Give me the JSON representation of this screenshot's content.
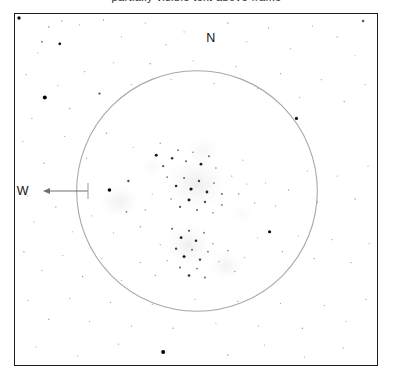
{
  "page": {
    "background_color": "#ffffff",
    "width": 393,
    "height": 381,
    "caption_clipped": "partially visible text above frame"
  },
  "frame": {
    "border_color": "#1b1b1b",
    "border_width": 1.5,
    "fill_color": "#ffffff",
    "x": 14,
    "y": 13,
    "width": 364,
    "height": 353
  },
  "field_circle": {
    "name": "eyepiece-field-of-view",
    "center_x": 197,
    "center_y": 191,
    "radius": 121,
    "stroke_color": "#a9a9a9",
    "stroke_width": 1.1,
    "fill": "none"
  },
  "compass": {
    "north_label": "N",
    "south_label": "S",
    "east_label": "E",
    "west_label": "W",
    "arrow_direction": "west",
    "arrow_color": "#6f6f6f"
  },
  "chart_data": {
    "type": "scatter",
    "xlabel": "",
    "ylabel": "",
    "xlim": [
      14,
      378
    ],
    "ylim": [
      13,
      366
    ],
    "grid": false,
    "legend": null,
    "annotations": [
      "N",
      "E",
      "S",
      "W"
    ],
    "nebulous_patches": [
      {
        "name": "central-cluster-glow",
        "cx": 196,
        "cy": 184,
        "rx": 36,
        "ry": 30,
        "opacity": 0.2
      },
      {
        "name": "west-glow",
        "cx": 119,
        "cy": 201,
        "rx": 24,
        "ry": 20,
        "opacity": 0.16
      },
      {
        "name": "south-cluster-glow",
        "cx": 189,
        "cy": 246,
        "rx": 26,
        "ry": 24,
        "opacity": 0.19
      },
      {
        "name": "southeast-glow",
        "cx": 226,
        "cy": 266,
        "rx": 19,
        "ry": 17,
        "opacity": 0.15
      },
      {
        "name": "north-halo",
        "cx": 203,
        "cy": 150,
        "rx": 22,
        "ry": 16,
        "opacity": 0.1
      },
      {
        "name": "faint-northwest-haze",
        "cx": 152,
        "cy": 167,
        "rx": 16,
        "ry": 13,
        "opacity": 0.08
      },
      {
        "name": "faint-east-haze",
        "cx": 243,
        "cy": 214,
        "rx": 14,
        "ry": 12,
        "opacity": 0.07
      }
    ],
    "stars": [
      {
        "x": 18,
        "y": 17,
        "r": 1.7,
        "m": 0.95
      },
      {
        "x": 41,
        "y": 41,
        "r": 1.0,
        "m": 0.35
      },
      {
        "x": 48,
        "y": 26,
        "r": 0.8,
        "m": 0.28
      },
      {
        "x": 61,
        "y": 20,
        "r": 0.7,
        "m": 0.22
      },
      {
        "x": 37,
        "y": 52,
        "r": 0.6,
        "m": 0.18
      },
      {
        "x": 59,
        "y": 43,
        "r": 1.4,
        "m": 0.92
      },
      {
        "x": 79,
        "y": 24,
        "r": 0.6,
        "m": 0.2
      },
      {
        "x": 103,
        "y": 19,
        "r": 0.7,
        "m": 0.24
      },
      {
        "x": 121,
        "y": 36,
        "r": 0.6,
        "m": 0.17
      },
      {
        "x": 145,
        "y": 22,
        "r": 0.6,
        "m": 0.2
      },
      {
        "x": 166,
        "y": 44,
        "r": 0.7,
        "m": 0.22
      },
      {
        "x": 184,
        "y": 31,
        "r": 0.6,
        "m": 0.16
      },
      {
        "x": 228,
        "y": 22,
        "r": 0.7,
        "m": 0.25
      },
      {
        "x": 247,
        "y": 41,
        "r": 0.6,
        "m": 0.19
      },
      {
        "x": 269,
        "y": 27,
        "r": 0.7,
        "m": 0.23
      },
      {
        "x": 291,
        "y": 48,
        "r": 0.6,
        "m": 0.18
      },
      {
        "x": 313,
        "y": 25,
        "r": 0.6,
        "m": 0.2
      },
      {
        "x": 338,
        "y": 36,
        "r": 0.7,
        "m": 0.22
      },
      {
        "x": 364,
        "y": 20,
        "r": 1.3,
        "m": 0.55
      },
      {
        "x": 356,
        "y": 55,
        "r": 0.6,
        "m": 0.17
      },
      {
        "x": 25,
        "y": 74,
        "r": 0.7,
        "m": 0.24
      },
      {
        "x": 44,
        "y": 97,
        "r": 2.0,
        "m": 1.0
      },
      {
        "x": 31,
        "y": 118,
        "r": 0.6,
        "m": 0.18
      },
      {
        "x": 57,
        "y": 85,
        "r": 0.6,
        "m": 0.19
      },
      {
        "x": 69,
        "y": 108,
        "r": 0.7,
        "m": 0.26
      },
      {
        "x": 84,
        "y": 71,
        "r": 0.6,
        "m": 0.21
      },
      {
        "x": 99,
        "y": 93,
        "r": 1.1,
        "m": 0.6
      },
      {
        "x": 113,
        "y": 62,
        "r": 0.6,
        "m": 0.18
      },
      {
        "x": 131,
        "y": 84,
        "r": 0.6,
        "m": 0.2
      },
      {
        "x": 150,
        "y": 63,
        "r": 0.7,
        "m": 0.27
      },
      {
        "x": 171,
        "y": 79,
        "r": 0.6,
        "m": 0.19
      },
      {
        "x": 193,
        "y": 60,
        "r": 0.6,
        "m": 0.17
      },
      {
        "x": 214,
        "y": 83,
        "r": 0.7,
        "m": 0.24
      },
      {
        "x": 236,
        "y": 66,
        "r": 0.6,
        "m": 0.2
      },
      {
        "x": 258,
        "y": 88,
        "r": 0.6,
        "m": 0.18
      },
      {
        "x": 281,
        "y": 73,
        "r": 0.7,
        "m": 0.23
      },
      {
        "x": 300,
        "y": 97,
        "r": 0.6,
        "m": 0.19
      },
      {
        "x": 322,
        "y": 79,
        "r": 0.6,
        "m": 0.21
      },
      {
        "x": 345,
        "y": 101,
        "r": 0.7,
        "m": 0.25
      },
      {
        "x": 366,
        "y": 84,
        "r": 0.6,
        "m": 0.18
      },
      {
        "x": 297,
        "y": 118,
        "r": 1.6,
        "m": 0.9
      },
      {
        "x": 22,
        "y": 141,
        "r": 0.6,
        "m": 0.19
      },
      {
        "x": 43,
        "y": 163,
        "r": 0.7,
        "m": 0.24
      },
      {
        "x": 64,
        "y": 136,
        "r": 0.6,
        "m": 0.18
      },
      {
        "x": 86,
        "y": 158,
        "r": 0.6,
        "m": 0.2
      },
      {
        "x": 106,
        "y": 133,
        "r": 0.7,
        "m": 0.26
      },
      {
        "x": 109,
        "y": 190,
        "r": 1.8,
        "m": 0.97
      },
      {
        "x": 128,
        "y": 181,
        "r": 1.2,
        "m": 0.62
      },
      {
        "x": 133,
        "y": 147,
        "r": 0.6,
        "m": 0.18
      },
      {
        "x": 126,
        "y": 212,
        "r": 0.9,
        "m": 0.4
      },
      {
        "x": 140,
        "y": 227,
        "r": 0.7,
        "m": 0.27
      },
      {
        "x": 113,
        "y": 233,
        "r": 0.6,
        "m": 0.2
      },
      {
        "x": 156,
        "y": 155,
        "r": 1.5,
        "m": 0.88
      },
      {
        "x": 163,
        "y": 166,
        "r": 1.1,
        "m": 0.58
      },
      {
        "x": 172,
        "y": 158,
        "r": 1.3,
        "m": 0.75
      },
      {
        "x": 178,
        "y": 150,
        "r": 0.9,
        "m": 0.44
      },
      {
        "x": 186,
        "y": 161,
        "r": 1.0,
        "m": 0.5
      },
      {
        "x": 193,
        "y": 152,
        "r": 0.8,
        "m": 0.36
      },
      {
        "x": 201,
        "y": 164,
        "r": 1.4,
        "m": 0.84
      },
      {
        "x": 209,
        "y": 156,
        "r": 1.0,
        "m": 0.48
      },
      {
        "x": 216,
        "y": 168,
        "r": 0.8,
        "m": 0.34
      },
      {
        "x": 167,
        "y": 177,
        "r": 0.9,
        "m": 0.42
      },
      {
        "x": 176,
        "y": 186,
        "r": 1.3,
        "m": 0.78
      },
      {
        "x": 184,
        "y": 178,
        "r": 1.0,
        "m": 0.52
      },
      {
        "x": 191,
        "y": 189,
        "r": 1.6,
        "m": 0.93
      },
      {
        "x": 199,
        "y": 181,
        "r": 1.2,
        "m": 0.66
      },
      {
        "x": 207,
        "y": 192,
        "r": 1.4,
        "m": 0.82
      },
      {
        "x": 214,
        "y": 183,
        "r": 0.9,
        "m": 0.44
      },
      {
        "x": 222,
        "y": 194,
        "r": 1.0,
        "m": 0.49
      },
      {
        "x": 171,
        "y": 199,
        "r": 0.8,
        "m": 0.33
      },
      {
        "x": 180,
        "y": 207,
        "r": 1.1,
        "m": 0.57
      },
      {
        "x": 189,
        "y": 200,
        "r": 1.5,
        "m": 0.89
      },
      {
        "x": 197,
        "y": 210,
        "r": 1.0,
        "m": 0.47
      },
      {
        "x": 205,
        "y": 202,
        "r": 1.2,
        "m": 0.64
      },
      {
        "x": 213,
        "y": 213,
        "r": 0.8,
        "m": 0.35
      },
      {
        "x": 222,
        "y": 205,
        "r": 0.9,
        "m": 0.41
      },
      {
        "x": 232,
        "y": 176,
        "r": 0.7,
        "m": 0.26
      },
      {
        "x": 239,
        "y": 194,
        "r": 0.8,
        "m": 0.31
      },
      {
        "x": 247,
        "y": 184,
        "r": 0.6,
        "m": 0.21
      },
      {
        "x": 160,
        "y": 143,
        "r": 0.7,
        "m": 0.28
      },
      {
        "x": 152,
        "y": 194,
        "r": 0.6,
        "m": 0.22
      },
      {
        "x": 145,
        "y": 210,
        "r": 0.7,
        "m": 0.25
      },
      {
        "x": 243,
        "y": 160,
        "r": 0.6,
        "m": 0.19
      },
      {
        "x": 255,
        "y": 203,
        "r": 0.7,
        "m": 0.27
      },
      {
        "x": 266,
        "y": 183,
        "r": 0.6,
        "m": 0.18
      },
      {
        "x": 276,
        "y": 206,
        "r": 0.6,
        "m": 0.2
      },
      {
        "x": 289,
        "y": 190,
        "r": 0.7,
        "m": 0.24
      },
      {
        "x": 308,
        "y": 171,
        "r": 0.6,
        "m": 0.19
      },
      {
        "x": 318,
        "y": 202,
        "r": 0.7,
        "m": 0.25
      },
      {
        "x": 338,
        "y": 176,
        "r": 0.6,
        "m": 0.18
      },
      {
        "x": 356,
        "y": 199,
        "r": 0.7,
        "m": 0.23
      },
      {
        "x": 369,
        "y": 166,
        "r": 0.6,
        "m": 0.2
      },
      {
        "x": 27,
        "y": 196,
        "r": 0.6,
        "m": 0.17
      },
      {
        "x": 33,
        "y": 222,
        "r": 0.6,
        "m": 0.19
      },
      {
        "x": 55,
        "y": 207,
        "r": 0.7,
        "m": 0.24
      },
      {
        "x": 72,
        "y": 232,
        "r": 0.6,
        "m": 0.18
      },
      {
        "x": 91,
        "y": 216,
        "r": 0.6,
        "m": 0.2
      },
      {
        "x": 172,
        "y": 229,
        "r": 1.0,
        "m": 0.52
      },
      {
        "x": 181,
        "y": 238,
        "r": 1.4,
        "m": 0.85
      },
      {
        "x": 189,
        "y": 231,
        "r": 1.1,
        "m": 0.6
      },
      {
        "x": 196,
        "y": 241,
        "r": 1.3,
        "m": 0.77
      },
      {
        "x": 204,
        "y": 233,
        "r": 0.9,
        "m": 0.43
      },
      {
        "x": 176,
        "y": 249,
        "r": 1.2,
        "m": 0.68
      },
      {
        "x": 184,
        "y": 257,
        "r": 1.5,
        "m": 0.91
      },
      {
        "x": 192,
        "y": 250,
        "r": 1.0,
        "m": 0.5
      },
      {
        "x": 200,
        "y": 260,
        "r": 1.2,
        "m": 0.7
      },
      {
        "x": 208,
        "y": 252,
        "r": 0.9,
        "m": 0.4
      },
      {
        "x": 180,
        "y": 268,
        "r": 1.0,
        "m": 0.53
      },
      {
        "x": 189,
        "y": 276,
        "r": 1.3,
        "m": 0.76
      },
      {
        "x": 197,
        "y": 269,
        "r": 0.9,
        "m": 0.44
      },
      {
        "x": 205,
        "y": 278,
        "r": 1.0,
        "m": 0.48
      },
      {
        "x": 213,
        "y": 244,
        "r": 0.8,
        "m": 0.32
      },
      {
        "x": 219,
        "y": 262,
        "r": 0.7,
        "m": 0.28
      },
      {
        "x": 228,
        "y": 251,
        "r": 0.8,
        "m": 0.33
      },
      {
        "x": 235,
        "y": 272,
        "r": 0.7,
        "m": 0.26
      },
      {
        "x": 245,
        "y": 258,
        "r": 0.6,
        "m": 0.21
      },
      {
        "x": 167,
        "y": 261,
        "r": 0.7,
        "m": 0.27
      },
      {
        "x": 160,
        "y": 245,
        "r": 0.6,
        "m": 0.2
      },
      {
        "x": 155,
        "y": 276,
        "r": 0.7,
        "m": 0.24
      },
      {
        "x": 270,
        "y": 232,
        "r": 1.6,
        "m": 0.94
      },
      {
        "x": 258,
        "y": 238,
        "r": 0.6,
        "m": 0.2
      },
      {
        "x": 283,
        "y": 252,
        "r": 0.7,
        "m": 0.25
      },
      {
        "x": 299,
        "y": 236,
        "r": 0.6,
        "m": 0.18
      },
      {
        "x": 315,
        "y": 259,
        "r": 0.7,
        "m": 0.23
      },
      {
        "x": 333,
        "y": 240,
        "r": 0.6,
        "m": 0.19
      },
      {
        "x": 352,
        "y": 263,
        "r": 0.7,
        "m": 0.24
      },
      {
        "x": 370,
        "y": 244,
        "r": 0.6,
        "m": 0.18
      },
      {
        "x": 23,
        "y": 252,
        "r": 0.7,
        "m": 0.25
      },
      {
        "x": 41,
        "y": 271,
        "r": 0.6,
        "m": 0.18
      },
      {
        "x": 62,
        "y": 256,
        "r": 0.6,
        "m": 0.2
      },
      {
        "x": 82,
        "y": 277,
        "r": 0.7,
        "m": 0.24
      },
      {
        "x": 101,
        "y": 259,
        "r": 0.6,
        "m": 0.19
      },
      {
        "x": 121,
        "y": 281,
        "r": 0.6,
        "m": 0.21
      },
      {
        "x": 140,
        "y": 263,
        "r": 0.7,
        "m": 0.26
      },
      {
        "x": 27,
        "y": 301,
        "r": 0.6,
        "m": 0.18
      },
      {
        "x": 48,
        "y": 320,
        "r": 0.7,
        "m": 0.24
      },
      {
        "x": 69,
        "y": 299,
        "r": 0.6,
        "m": 0.19
      },
      {
        "x": 89,
        "y": 322,
        "r": 0.6,
        "m": 0.2
      },
      {
        "x": 110,
        "y": 303,
        "r": 0.7,
        "m": 0.25
      },
      {
        "x": 131,
        "y": 327,
        "r": 0.6,
        "m": 0.18
      },
      {
        "x": 152,
        "y": 305,
        "r": 0.6,
        "m": 0.21
      },
      {
        "x": 173,
        "y": 329,
        "r": 0.7,
        "m": 0.24
      },
      {
        "x": 195,
        "y": 300,
        "r": 0.6,
        "m": 0.19
      },
      {
        "x": 216,
        "y": 324,
        "r": 0.6,
        "m": 0.2
      },
      {
        "x": 238,
        "y": 302,
        "r": 0.7,
        "m": 0.26
      },
      {
        "x": 259,
        "y": 327,
        "r": 0.6,
        "m": 0.18
      },
      {
        "x": 281,
        "y": 304,
        "r": 0.6,
        "m": 0.21
      },
      {
        "x": 303,
        "y": 329,
        "r": 0.7,
        "m": 0.24
      },
      {
        "x": 325,
        "y": 306,
        "r": 0.6,
        "m": 0.19
      },
      {
        "x": 347,
        "y": 322,
        "r": 0.6,
        "m": 0.2
      },
      {
        "x": 367,
        "y": 300,
        "r": 0.7,
        "m": 0.25
      },
      {
        "x": 163,
        "y": 353,
        "r": 2.0,
        "m": 1.0
      },
      {
        "x": 35,
        "y": 348,
        "r": 0.6,
        "m": 0.18
      },
      {
        "x": 77,
        "y": 357,
        "r": 0.6,
        "m": 0.2
      },
      {
        "x": 118,
        "y": 345,
        "r": 0.7,
        "m": 0.23
      },
      {
        "x": 228,
        "y": 356,
        "r": 0.7,
        "m": 0.27
      },
      {
        "x": 265,
        "y": 346,
        "r": 0.6,
        "m": 0.19
      },
      {
        "x": 305,
        "y": 358,
        "r": 0.6,
        "m": 0.21
      },
      {
        "x": 344,
        "y": 349,
        "r": 0.7,
        "m": 0.24
      }
    ]
  }
}
